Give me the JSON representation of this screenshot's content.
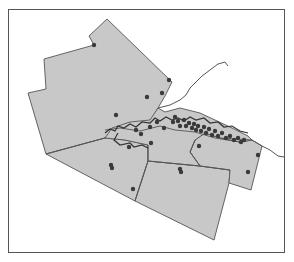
{
  "map": {
    "width": 294,
    "height": 262,
    "frame": {
      "x": 8,
      "y": 9,
      "w": 277,
      "h": 244,
      "stroke": "#555555"
    },
    "colors": {
      "region_fill": "#c8c8c8",
      "region_stroke": "#555555",
      "boundary": "#555555",
      "urban_outline": "#333333",
      "marker": "#3a3a3a",
      "shoreline": "#555555"
    },
    "regions": [
      {
        "name": "north-region",
        "points": "107,19 89,36 94,45 44,59 46,89 28,93 46,154 105,138 112,133 130,128 150,122 158,108 165,96 172,82 107,19"
      },
      {
        "name": "southwest-region",
        "points": "46,154 105,138 125,140 148,145 148,161 135,201 46,154"
      },
      {
        "name": "south-region",
        "points": "148,161 135,201 214,240 229,183 230,170 200,166 148,161"
      },
      {
        "name": "east-region",
        "points": "229,183 251,190 262,146 252,140 240,142 220,138 205,133 195,140 190,152 200,166 230,170 229,183"
      },
      {
        "name": "urban-core",
        "points": "105,138 112,128 130,122 150,120 158,108 165,112 180,108 200,113 215,120 232,128 248,136 252,140 240,142 220,138 205,133 195,140 190,152 200,166 148,161 148,145 125,140 105,138"
      }
    ],
    "boundaries": [
      "M46,154 L105,138",
      "M148,145 L148,161 L135,201",
      "M148,161 L200,166 L230,170",
      "M200,166 L190,152 L195,140",
      "M220,138 L252,140",
      "M105,130 L120,128 L140,131 L160,126 L175,130 L195,132 L215,138 L240,142"
    ],
    "urban_outline": "M105,133 L110,129 L115,131 L118,126 L124,128 L130,124 L136,127 L142,122 L150,123 L155,118 L160,121 L166,117 L172,120 L178,118 L184,121 L190,117 L196,120 L204,118 L210,123 L218,122 L224,127 L232,126 L240,131 L248,133 M118,133 L114,140 L120,145 L130,143 L134,147 L142,145 L148,148",
    "shoreline": "M158,108 L170,105 L180,100 L186,95 L190,88 L196,82 L202,76 L210,70 L218,64 L225,62 L228,66 M252,140 L262,146 L270,150 L278,156 L284,157",
    "markers": [
      {
        "x": 94,
        "y": 45
      },
      {
        "x": 169,
        "y": 80
      },
      {
        "x": 162,
        "y": 93
      },
      {
        "x": 147,
        "y": 97
      },
      {
        "x": 116,
        "y": 115
      },
      {
        "x": 129,
        "y": 147
      },
      {
        "x": 111,
        "y": 165
      },
      {
        "x": 112,
        "y": 168
      },
      {
        "x": 133,
        "y": 189
      },
      {
        "x": 180,
        "y": 169
      },
      {
        "x": 181,
        "y": 172
      },
      {
        "x": 151,
        "y": 143
      },
      {
        "x": 173,
        "y": 122
      },
      {
        "x": 150,
        "y": 127
      },
      {
        "x": 157,
        "y": 122
      },
      {
        "x": 164,
        "y": 128
      },
      {
        "x": 175,
        "y": 117
      },
      {
        "x": 178,
        "y": 121
      },
      {
        "x": 180,
        "y": 126
      },
      {
        "x": 184,
        "y": 120
      },
      {
        "x": 186,
        "y": 126
      },
      {
        "x": 189,
        "y": 123
      },
      {
        "x": 192,
        "y": 128
      },
      {
        "x": 194,
        "y": 124
      },
      {
        "x": 196,
        "y": 130
      },
      {
        "x": 198,
        "y": 126
      },
      {
        "x": 201,
        "y": 131
      },
      {
        "x": 204,
        "y": 127
      },
      {
        "x": 206,
        "y": 133
      },
      {
        "x": 209,
        "y": 129
      },
      {
        "x": 212,
        "y": 135
      },
      {
        "x": 215,
        "y": 131
      },
      {
        "x": 218,
        "y": 136
      },
      {
        "x": 222,
        "y": 133
      },
      {
        "x": 226,
        "y": 138
      },
      {
        "x": 230,
        "y": 136
      },
      {
        "x": 234,
        "y": 140
      },
      {
        "x": 238,
        "y": 138
      },
      {
        "x": 241,
        "y": 142
      },
      {
        "x": 244,
        "y": 140
      },
      {
        "x": 199,
        "y": 146
      },
      {
        "x": 258,
        "y": 155
      },
      {
        "x": 248,
        "y": 172
      },
      {
        "x": 141,
        "y": 134
      },
      {
        "x": 136,
        "y": 130
      }
    ]
  }
}
